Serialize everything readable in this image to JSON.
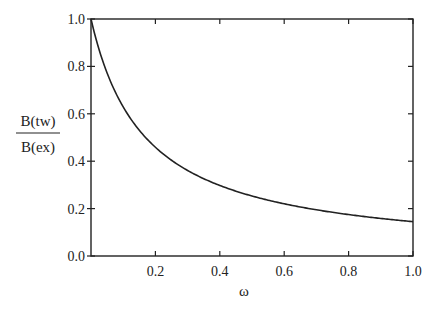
{
  "chart_data": {
    "type": "line",
    "title": "",
    "xlabel": "ω",
    "ylabel_numerator": "B(tw)",
    "ylabel_denominator": "B(ex)",
    "xlim": [
      0.0,
      1.0
    ],
    "ylim": [
      0.0,
      1.0
    ],
    "x_ticks": [
      "0.2",
      "0.4",
      "0.6",
      "0.8",
      "1.0"
    ],
    "x_tick_values": [
      0.2,
      0.4,
      0.6,
      0.8,
      1.0
    ],
    "y_ticks": [
      "0.0",
      "0.2",
      "0.4",
      "0.6",
      "0.8",
      "1.0"
    ],
    "y_tick_values": [
      0.0,
      0.2,
      0.4,
      0.6,
      0.8,
      1.0
    ],
    "grid": false,
    "legend": null,
    "series": [
      {
        "name": "B(tw)/B(ex)",
        "x": [
          0.0,
          0.05,
          0.1,
          0.15,
          0.2,
          0.3,
          0.4,
          0.5,
          0.6,
          0.7,
          0.8,
          0.9,
          1.0
        ],
        "values": [
          1.0,
          0.77,
          0.63,
          0.53,
          0.46,
          0.36,
          0.3,
          0.25,
          0.22,
          0.19,
          0.17,
          0.16,
          0.145
        ]
      }
    ],
    "line_color": "#222222"
  }
}
